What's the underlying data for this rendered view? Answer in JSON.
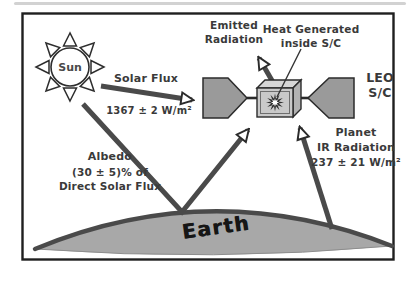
{
  "diagram": {
    "sun": {
      "label": "Sun"
    },
    "arrows": {
      "solar_flux": {
        "label": "Solar Flux",
        "value": "1367 ± 2 W/m²"
      },
      "emitted_radiation": {
        "line1": "Emitted",
        "line2": "Radiation"
      },
      "albedo": {
        "line1": "Albedo",
        "line2": "(30 ± 5)% of",
        "line3": "Direct Solar Flux"
      },
      "planet_ir": {
        "line1": "Planet",
        "line2": "IR Radiation",
        "value": "237 ± 21 W/m²"
      }
    },
    "spacecraft": {
      "heat_label_line1": "Heat Generated",
      "heat_label_line2": "inside S/C",
      "type_line1": "LEO",
      "type_line2": "S/C"
    },
    "earth": {
      "label": "Earth"
    },
    "colors": {
      "arrow_shaft": "#4a4a4a",
      "arrowhead_fill": "#ffffff",
      "outline": "#2b2b2b",
      "solar_panel": "#9a9a9a",
      "box_front": "#c9c9c9",
      "box_top": "#d6d6d6",
      "box_side": "#b2b2b2",
      "earth_fill": "#a8a8a8",
      "earth_horizon": "#4a4a4a",
      "text": "#3a3a3a",
      "frame": "#1f1f1f"
    }
  }
}
